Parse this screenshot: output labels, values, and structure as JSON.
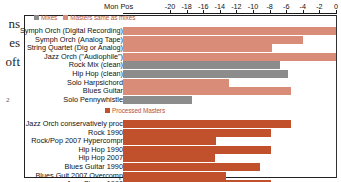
{
  "page_bleed": {
    "lines": [
      "ns",
      "es",
      "oft"
    ],
    "margin_mark": "2"
  },
  "chart_data": {
    "type": "bar",
    "orientation": "horizontal",
    "title": "",
    "xlabel": "Mon Pos",
    "ylabel": "",
    "xlim": [
      -20,
      0
    ],
    "xticks": [
      -20,
      -18,
      -16,
      -14,
      -12,
      -10,
      -8,
      -6,
      -4,
      -2,
      0
    ],
    "xtick_labels": [
      "-20",
      "-18",
      "-16",
      "-14",
      "-12",
      "-10",
      "-8",
      "-6",
      "-4",
      "-2",
      "0"
    ],
    "grid": false,
    "legend_position": "inside-top-left",
    "colors": {
      "mixes": "#8c8c8c",
      "masters_same_as_mixes": "#d98d78",
      "processed_masters": "#c0512c"
    },
    "groups": [
      {
        "legend": [
          {
            "label": "Mixes",
            "series": "mixes",
            "color": "#8c8c8c"
          },
          {
            "label": "Masters same as mixes",
            "series": "masters_same_as_mixes",
            "color": "#d98d78"
          }
        ],
        "categories": [
          "Symph Orch (Digital Recording)",
          "Symph Orch (Analog Tape)",
          "String Quartet (Dig or Analog)",
          "Jazz Orch (\"Audiophile\")",
          "Rock Mix (clean)",
          "Hip Hop (clean)",
          "Solo Harpsichord",
          "Blues Guitar",
          "Solo Pennywhistle"
        ],
        "values": [
          0.0,
          -4.0,
          -7.7,
          0.0,
          -6.7,
          -5.8,
          -12.9,
          -5.4,
          -17.4
        ],
        "series_of": [
          "masters_same_as_mixes",
          "masters_same_as_mixes",
          "masters_same_as_mixes",
          "masters_same_as_mixes",
          "mixes",
          "mixes",
          "masters_same_as_mixes",
          "masters_same_as_mixes",
          "mixes"
        ]
      },
      {
        "legend": [
          {
            "label": "Processed Masters",
            "series": "processed_masters",
            "color": "#c0512c"
          }
        ],
        "categories": [
          "Jazz Orch conservatively proc",
          "Rock 1990",
          "Rock/Pop 2007 Hypercompr",
          "Hip Hop 1990",
          "Hip Hop 2007",
          "Blues Guitar 1990",
          "Blues Guit 2007 Overcomp",
          "Jazz Singer 1990",
          "Jazz Singer 2004 Overcompr"
        ],
        "values": [
          -5.4,
          -7.8,
          -14.4,
          -7.8,
          -14.6,
          -9.1,
          -13.3,
          -7.8,
          -15.2
        ],
        "series_of": [
          "processed_masters",
          "processed_masters",
          "processed_masters",
          "processed_masters",
          "processed_masters",
          "processed_masters",
          "processed_masters",
          "processed_masters",
          "processed_masters"
        ]
      }
    ]
  }
}
